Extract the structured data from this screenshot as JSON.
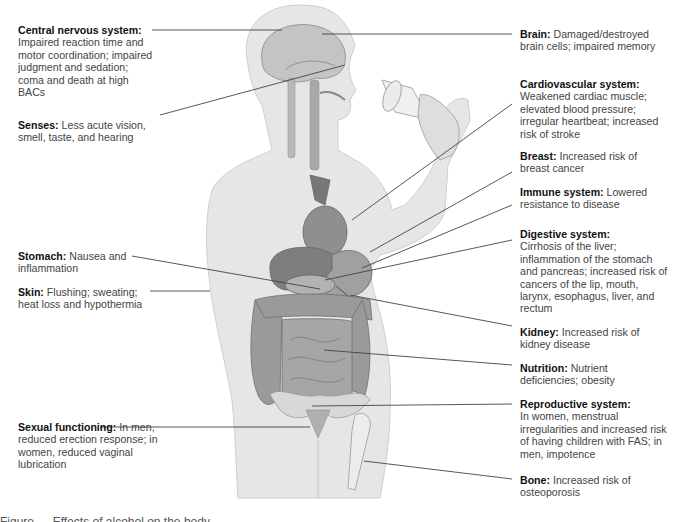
{
  "diagram": {
    "subject": "Effects of alcohol on the body",
    "labels": {
      "cns": {
        "title": "Central nervous system:",
        "text": "Impaired reaction time and motor coordination; impaired judgment and sedation; coma and death at high BACs"
      },
      "senses": {
        "title": "Senses:",
        "text": "Less acute vision, smell, taste, and hearing"
      },
      "stomach": {
        "title": "Stomach:",
        "text": "Nausea and inflammation"
      },
      "skin": {
        "title": "Skin:",
        "text": "Flushing; sweating; heat loss and hypothermia"
      },
      "sexual": {
        "title": "Sexual functioning:",
        "text": "In men, reduced erection response; in women, reduced vaginal lubrication"
      },
      "brain": {
        "title": "Brain:",
        "text": "Damaged/destroyed brain cells; impaired memory"
      },
      "cardio": {
        "title": "Cardiovascular system:",
        "text": "Weakened cardiac muscle; elevated blood pressure; irregular heartbeat; increased risk of stroke"
      },
      "breast": {
        "title": "Breast:",
        "text": "Increased risk of breast cancer"
      },
      "immune": {
        "title": "Immune system:",
        "text": "Lowered resistance to disease"
      },
      "digestive": {
        "title": "Digestive system:",
        "text": "Cirrhosis of the liver; inflammation of the stomach and pancreas; increased risk of cancers of the lip, mouth, larynx, esophagus, liver, and rectum"
      },
      "kidney": {
        "title": "Kidney:",
        "text": "Increased risk of kidney disease"
      },
      "nutrition": {
        "title": "Nutrition:",
        "text": "Nutrient deficiencies; obesity"
      },
      "reproductive": {
        "title": "Reproductive system:",
        "text": "In women, menstrual irregularities and increased risk of having children with FAS; in men, impotence"
      },
      "bone": {
        "title": "Bone:",
        "text": "Increased risk of osteoporosis"
      }
    },
    "caption": "Figure — Effects of alcohol on the body"
  },
  "colors": {
    "body": "#e4e4e4",
    "organ": "#8a8a8a",
    "line": "#444444",
    "title": "#111111",
    "text": "#444444"
  }
}
